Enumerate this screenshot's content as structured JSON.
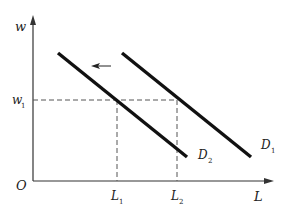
{
  "diagram": {
    "type": "labor-demand-shift",
    "colors": {
      "axes": "#333333",
      "curves": "#111111",
      "guides": "#555555",
      "text": "#222222"
    },
    "axes": {
      "y_label": "w",
      "x_label": "L",
      "origin_label": "O"
    },
    "curves": [
      {
        "name": "D1",
        "label": "D",
        "subscript": "1"
      },
      {
        "name": "D2",
        "label": "D",
        "subscript": "2"
      }
    ],
    "levels": {
      "w1": {
        "label": "w",
        "subscript": "1"
      },
      "L1": {
        "label": "L",
        "subscript": "1"
      },
      "L2": {
        "label": "L",
        "subscript": "2"
      }
    },
    "shift_arrow": {
      "direction": "left",
      "meaning": "demand decreases from D1 to D2"
    }
  }
}
